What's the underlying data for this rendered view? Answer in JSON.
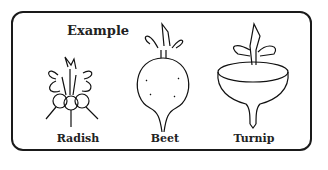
{
  "diagram": {
    "title": "Example",
    "items": [
      {
        "name": "radish",
        "label": "Radish"
      },
      {
        "name": "beet",
        "label": "Beet"
      },
      {
        "name": "turnip",
        "label": "Turnip"
      }
    ]
  }
}
